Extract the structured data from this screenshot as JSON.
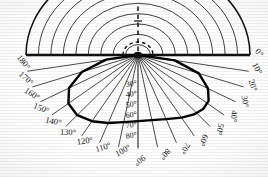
{
  "figure": {
    "type": "polar-net",
    "units": "degrees"
  },
  "chart_data": {
    "type": "line",
    "title": "",
    "subtitle": "",
    "xlabel": "",
    "ylabel": "",
    "projection": "polar-half-plane",
    "grid": true,
    "legend_position": "none",
    "angular_axis": {
      "label": "azimuth",
      "unit": "degree",
      "range": [
        0,
        180
      ],
      "tick_step": 10,
      "tick_labels": [
        "0°",
        "10°",
        "20°",
        "30°",
        "40°",
        "50°",
        "60°",
        "70°",
        "80°",
        "90°",
        "100°",
        "110°",
        "120°",
        "130°",
        "140°",
        "150°",
        "160°",
        "170°",
        "180°"
      ],
      "tick_values": [
        0,
        10,
        20,
        30,
        40,
        50,
        60,
        70,
        80,
        90,
        100,
        110,
        120,
        130,
        140,
        150,
        160,
        170,
        180
      ]
    },
    "radial_axis": {
      "label": "inclination",
      "unit": "degree",
      "range": [
        0,
        90
      ],
      "tick_step": 10,
      "visible_tick_labels": [
        "30°",
        "40°",
        "50°",
        "60°",
        "70°",
        "80°"
      ],
      "visible_tick_values": [
        30,
        40,
        50,
        60,
        70,
        80
      ]
    },
    "series": [
      {
        "name": "bounding-lobe",
        "style": "thick-solid",
        "points_deg_r": [
          [
            0,
            0.0
          ],
          [
            10,
            30.0
          ],
          [
            20,
            52.0
          ],
          [
            30,
            65.0
          ],
          [
            38,
            72.0
          ],
          [
            45,
            74.0
          ],
          [
            52,
            73.0
          ],
          [
            60,
            70.0
          ],
          [
            70,
            66.0
          ],
          [
            80,
            64.0
          ],
          [
            90,
            64.0
          ],
          [
            100,
            66.0
          ],
          [
            110,
            70.0
          ],
          [
            120,
            74.0
          ],
          [
            130,
            76.0
          ],
          [
            140,
            73.0
          ],
          [
            150,
            64.0
          ],
          [
            160,
            48.0
          ],
          [
            170,
            26.0
          ],
          [
            180,
            0.0
          ]
        ]
      },
      {
        "name": "outer-boundary",
        "style": "solid",
        "radius_deg": 90
      },
      {
        "name": "axis-dashed-vertical",
        "style": "dashed",
        "from_deg_r": [
          90,
          0
        ],
        "to_px_up": 52
      },
      {
        "name": "origin-dashed-arc",
        "style": "dashed",
        "radius_px": 15
      }
    ],
    "annotations": [
      {
        "text": "0°",
        "angle": 0,
        "placement": "rim-left"
      },
      {
        "text": "10°",
        "angle": 10,
        "placement": "rim-left"
      },
      {
        "text": "20°",
        "angle": 20,
        "placement": "rim-left"
      },
      {
        "text": "30°",
        "angle": 30,
        "placement": "rim-left"
      },
      {
        "text": "40°",
        "angle": 40,
        "placement": "rim-left"
      },
      {
        "text": "50°",
        "angle": 50,
        "placement": "rim-left"
      },
      {
        "text": "60°",
        "angle": 60,
        "placement": "rim-bottom"
      },
      {
        "text": "70°",
        "angle": 70,
        "placement": "rim-bottom"
      },
      {
        "text": "80°",
        "angle": 80,
        "placement": "rim-bottom"
      },
      {
        "text": "90°",
        "angle": 90,
        "placement": "rim-bottom"
      },
      {
        "text": "100°",
        "angle": 100,
        "placement": "rim-bottom"
      },
      {
        "text": "110°",
        "angle": 110,
        "placement": "rim-bottom"
      },
      {
        "text": "120°",
        "angle": 120,
        "placement": "rim-bottom"
      },
      {
        "text": "130°",
        "angle": 130,
        "placement": "rim-right"
      },
      {
        "text": "140°",
        "angle": 140,
        "placement": "rim-right"
      },
      {
        "text": "150°",
        "angle": 150,
        "placement": "rim-right"
      },
      {
        "text": "160°",
        "angle": 160,
        "placement": "rim-right"
      },
      {
        "text": "170°",
        "angle": 170,
        "placement": "rim-right"
      },
      {
        "text": "180°",
        "angle": 180,
        "placement": "rim-right"
      },
      {
        "text": "30°",
        "radius": 30,
        "placement": "meridian"
      },
      {
        "text": "40°",
        "radius": 40,
        "placement": "meridian"
      },
      {
        "text": "50°",
        "radius": 50,
        "placement": "meridian"
      },
      {
        "text": "60°",
        "radius": 60,
        "placement": "meridian"
      },
      {
        "text": "70°",
        "radius": 70,
        "placement": "meridian"
      },
      {
        "text": "80°",
        "radius": 80,
        "placement": "meridian"
      }
    ]
  },
  "rim_labels": [
    {
      "id": "rim-0",
      "text": "0°"
    },
    {
      "id": "rim-10",
      "text": "10°"
    },
    {
      "id": "rim-20",
      "text": "20°"
    },
    {
      "id": "rim-30",
      "text": "30°"
    },
    {
      "id": "rim-40",
      "text": "40°"
    },
    {
      "id": "rim-50",
      "text": "50°"
    },
    {
      "id": "rim-60",
      "text": "60°"
    },
    {
      "id": "rim-70",
      "text": "70°"
    },
    {
      "id": "rim-80",
      "text": "80°"
    },
    {
      "id": "rim-90",
      "text": "90°"
    },
    {
      "id": "rim-100",
      "text": "100°"
    },
    {
      "id": "rim-110",
      "text": "110°"
    },
    {
      "id": "rim-120",
      "text": "120°"
    },
    {
      "id": "rim-130",
      "text": "130°"
    },
    {
      "id": "rim-140",
      "text": "140°"
    },
    {
      "id": "rim-150",
      "text": "150°"
    },
    {
      "id": "rim-160",
      "text": "160°"
    },
    {
      "id": "rim-170",
      "text": "170°"
    },
    {
      "id": "rim-180",
      "text": "180°"
    }
  ],
  "meridian_labels": [
    {
      "id": "mer-30",
      "text": "30°"
    },
    {
      "id": "mer-40",
      "text": "40°"
    },
    {
      "id": "mer-50",
      "text": "50°"
    },
    {
      "id": "mer-60",
      "text": "60°"
    },
    {
      "id": "mer-70",
      "text": "70°"
    },
    {
      "id": "mer-80",
      "text": "80°"
    }
  ],
  "colors": {
    "ink": "#111111",
    "grid": "#2a2a2a",
    "paper": "#ffffff",
    "thick_curve": "#000000"
  }
}
